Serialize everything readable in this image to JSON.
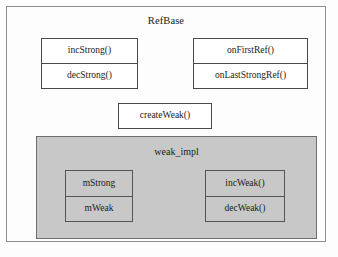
{
  "diagram": {
    "title": "RefBase",
    "outer_class": {
      "name": "RefBase",
      "members": [
        {
          "group": "strong-ref-ops",
          "rows": [
            "incStrong()",
            "decStrong()"
          ]
        },
        {
          "group": "on-ref-callbacks",
          "rows": [
            "onFirstRef()",
            "onLastStrongRef()"
          ]
        },
        {
          "group": "create-weak-op",
          "rows": [
            "createWeak()"
          ]
        }
      ]
    },
    "nested_class": {
      "name": "weak_impl",
      "members": [
        {
          "group": "weak-impl-fields",
          "rows": [
            "mStrong",
            "mWeak"
          ]
        },
        {
          "group": "weak-ref-ops",
          "rows": [
            "incWeak()",
            "decWeak()"
          ]
        }
      ]
    },
    "colors": {
      "page_background": "#fdfdfd",
      "outer_border": "#8e8e8e",
      "box_border": "#4a4a4a",
      "box_fill": "#ffffff",
      "nested_panel_fill": "#c8c8c8",
      "nested_panel_border": "#6e6e6e",
      "text": "#1b1b1b"
    }
  }
}
